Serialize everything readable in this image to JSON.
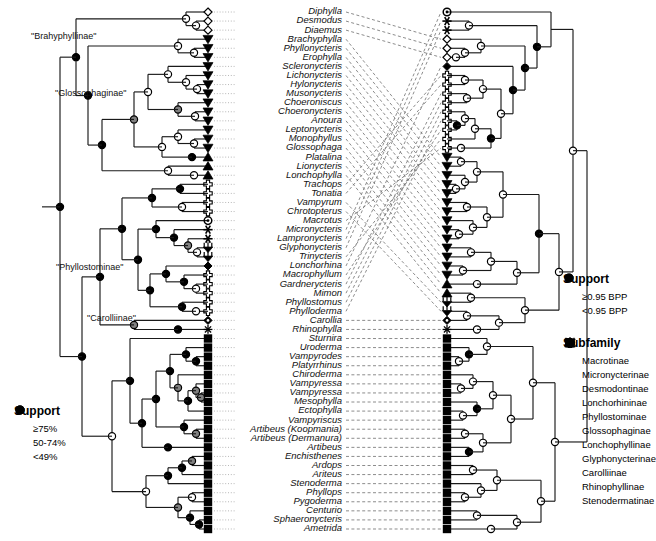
{
  "figure": {
    "type": "tanglegram",
    "left_tree": {
      "label": "left-phylogeny",
      "support_type": "bootstrap-percent"
    },
    "right_tree": {
      "label": "right-phylogeny",
      "support_type": "bayesian-posterior-probability"
    }
  },
  "taxa": [
    "Diphylla",
    "Desmodus",
    "Diaemus",
    "Brachyphylla",
    "Phyllonycteris",
    "Erophylla",
    "Scleronycteris",
    "Lichonycteris",
    "Hylonycteris",
    "Musonycteris",
    "Choeroniscus",
    "Choeronycteris",
    "Anoura",
    "Leptonycteris",
    "Monophyllus",
    "Glossophaga",
    "Platalina",
    "Lionycteris",
    "Lonchophylla",
    "Trachops",
    "Tonatia",
    "Vampyrum",
    "Chrotopterus",
    "Macrotus",
    "Micronycteris",
    "Lampronycteris",
    "Glyphonycteris",
    "Trinycteris",
    "Lonchorhina",
    "Macrophyllum",
    "Gardnerycteris",
    "Mimon",
    "Phyllostomus",
    "Phylloderma",
    "Carollia",
    "Rhinophylla",
    "Sturnira",
    "Uroderma",
    "Vampyrodes",
    "Platyrrhinus",
    "Chiroderma",
    "Vampyressa",
    "Vampyressa",
    "Mesophylla",
    "Ectophylla",
    "Vampyriscus",
    "Artibeus (Koopmania)",
    "Artibeus (Dermanura)",
    "Artibeus",
    "Enchisthenes",
    "Ardops",
    "Ariteus",
    "Stenoderma",
    "Phyllops",
    "Pygoderma",
    "Centurio",
    "Sphaeronycteris",
    "Ametrida"
  ],
  "clade_labels": [
    {
      "text": "\"Brahyphyllinae\"",
      "x": 31,
      "y": 31
    },
    {
      "text": "\"Glossophaginae\"",
      "x": 55,
      "y": 88
    },
    {
      "text": "\"Phyllostominae\"",
      "x": 56,
      "y": 262
    },
    {
      "text": "\"Carolliinae\"",
      "x": 87,
      "y": 313
    }
  ],
  "legend_support_left": {
    "title": "Support",
    "items": [
      {
        "symbol": "open-circle",
        "label": "≥75%"
      },
      {
        "symbol": "gray-circle",
        "label": "50-74%"
      },
      {
        "symbol": "black-circle",
        "label": "<49%"
      }
    ]
  },
  "legend_support_right": {
    "title": "Support",
    "items": [
      {
        "symbol": "open-circle",
        "label": "≥0.95 BPP"
      },
      {
        "symbol": "black-circle",
        "label": "<0.95 BPP"
      }
    ]
  },
  "legend_subfamily": {
    "title": "Subfamily",
    "items": [
      {
        "symbol": "macrotinae-circle",
        "label": "Macrotinae"
      },
      {
        "symbol": "micronycterinae-asterisk",
        "label": "Micronycterinae"
      },
      {
        "symbol": "desmodontinae-diamond",
        "label": "Desmodontinae"
      },
      {
        "symbol": "lonchorhininae-diamond",
        "label": "Lonchorhininae"
      },
      {
        "symbol": "phyllostominae-cross",
        "label": "Phyllostominae"
      },
      {
        "symbol": "glossophaginae-triangle-down",
        "label": "Glossophaginae"
      },
      {
        "symbol": "lonchophyllinae-triangle-up",
        "label": "Lonchophyllinae"
      },
      {
        "symbol": "glyphonycterinae-trident",
        "label": "Glyphonycterinae"
      },
      {
        "symbol": "carolliinae-diamond",
        "label": "Carolliinae"
      },
      {
        "symbol": "rhinophyllinae-asterisk",
        "label": "Rhinophyllinae"
      },
      {
        "symbol": "stenodermatinae-square",
        "label": "Stenodermatinae"
      }
    ]
  },
  "colors": {
    "line": "#1a1a1a",
    "gray_node": "#808080",
    "black_node": "#000000",
    "open_node": "#ffffff",
    "dashed_link": "#6e6e6e"
  },
  "tip_subfamilies": [
    "desmodontinae-diamond",
    "desmodontinae-diamond",
    "desmodontinae-diamond",
    "glossophaginae-triangle-down",
    "glossophaginae-triangle-down",
    "glossophaginae-triangle-down",
    "glossophaginae-triangle-down",
    "glossophaginae-triangle-down",
    "glossophaginae-triangle-down",
    "glossophaginae-triangle-down",
    "glossophaginae-triangle-down",
    "glossophaginae-triangle-down",
    "glossophaginae-triangle-down",
    "glossophaginae-triangle-down",
    "glossophaginae-triangle-down",
    "glossophaginae-triangle-down",
    "lonchophyllinae-triangle-up",
    "lonchophyllinae-triangle-up",
    "lonchophyllinae-triangle-up",
    "phyllostominae-cross",
    "phyllostominae-cross",
    "phyllostominae-cross",
    "phyllostominae-cross",
    "macrotinae-circle",
    "micronycterinae-asterisk",
    "micronycterinae-asterisk",
    "glyphonycterinae-trident",
    "glyphonycterinae-trident",
    "lonchorhininae-diamond",
    "phyllostominae-cross",
    "phyllostominae-cross",
    "phyllostominae-cross",
    "phyllostominae-cross",
    "phyllostominae-cross",
    "carolliinae-diamond",
    "rhinophyllinae-asterisk",
    "stenodermatinae-square",
    "stenodermatinae-square",
    "stenodermatinae-square",
    "stenodermatinae-square",
    "stenodermatinae-square",
    "stenodermatinae-square",
    "stenodermatinae-square",
    "stenodermatinae-square",
    "stenodermatinae-square",
    "stenodermatinae-square",
    "stenodermatinae-square",
    "stenodermatinae-square",
    "stenodermatinae-square",
    "stenodermatinae-square",
    "stenodermatinae-square",
    "stenodermatinae-square",
    "stenodermatinae-square",
    "stenodermatinae-square",
    "stenodermatinae-square",
    "stenodermatinae-square",
    "stenodermatinae-square",
    "stenodermatinae-square"
  ]
}
